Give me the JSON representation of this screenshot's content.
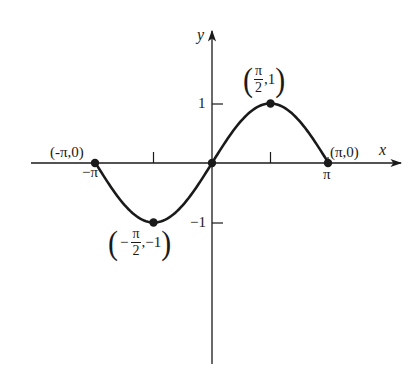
{
  "chart_data": {
    "type": "line",
    "title": "",
    "function": "y = sin(x), -π ≤ x ≤ π",
    "xlabel": "x",
    "ylabel": "y",
    "xlim": [
      -3.5,
      5.1
    ],
    "ylim": [
      -3.4,
      2.3
    ],
    "grid": false,
    "legend": null,
    "x_ticks": [
      {
        "value": -3.14159,
        "label": "−π"
      },
      {
        "value": -1.5708,
        "label": ""
      },
      {
        "value": 1.5708,
        "label": ""
      },
      {
        "value": 3.14159,
        "label": "π"
      }
    ],
    "y_ticks": [
      {
        "value": 1,
        "label": "1"
      },
      {
        "value": -1,
        "label": "−1"
      }
    ],
    "series": [
      {
        "name": "sin x",
        "x": [
          -3.14159,
          -2.35619,
          -1.5708,
          -0.7854,
          0,
          0.7854,
          1.5708,
          2.35619,
          3.14159
        ],
        "y": [
          0,
          -0.7071,
          -1,
          -0.7071,
          0,
          0.7071,
          1,
          0.7071,
          0
        ]
      }
    ],
    "marked_points": [
      {
        "x": -3.14159,
        "y": 0,
        "label": "(-π,0)"
      },
      {
        "x": -1.5708,
        "y": -1,
        "label": "(−π/2,−1)"
      },
      {
        "x": 0,
        "y": 0,
        "label": ""
      },
      {
        "x": 1.5708,
        "y": 1,
        "label": "(π/2,1)"
      },
      {
        "x": 3.14159,
        "y": 0,
        "label": "(π,0)"
      }
    ]
  },
  "axes": {
    "x_label": "x",
    "y_label": "y",
    "x_tick_pi": "π",
    "x_tick_neg_pi": "−π",
    "y_tick_1": "1",
    "y_tick_neg1": "−1"
  },
  "annotations": {
    "neg_pi_point": "(-π,0)",
    "pi_point": "(π,0)",
    "max_point": {
      "open": "(",
      "num": "π",
      "den": "2",
      "rest": ",1",
      "close": ")"
    },
    "min_point": {
      "open": "(",
      "sign": "−",
      "num": "π",
      "den": "2",
      "rest": ",−1",
      "close": ")"
    }
  },
  "colors": {
    "ink": "#1a1a1a",
    "background": "#ffffff"
  }
}
